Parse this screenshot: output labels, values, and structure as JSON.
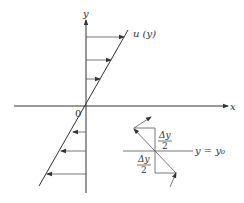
{
  "diagram": {
    "axes": {
      "x_label": "x",
      "y_label": "y",
      "origin_label": "0"
    },
    "profile": {
      "label": "u (y)",
      "description": "linear velocity profile u(y) through origin",
      "upper_arrows_count": 3,
      "lower_arrows_count": 3
    },
    "inset": {
      "reference_line_label": "y = y₀",
      "upper_fraction": {
        "numerator": "Δy",
        "denominator": "2"
      },
      "lower_fraction": {
        "numerator": "Δy",
        "denominator": "2"
      }
    }
  }
}
